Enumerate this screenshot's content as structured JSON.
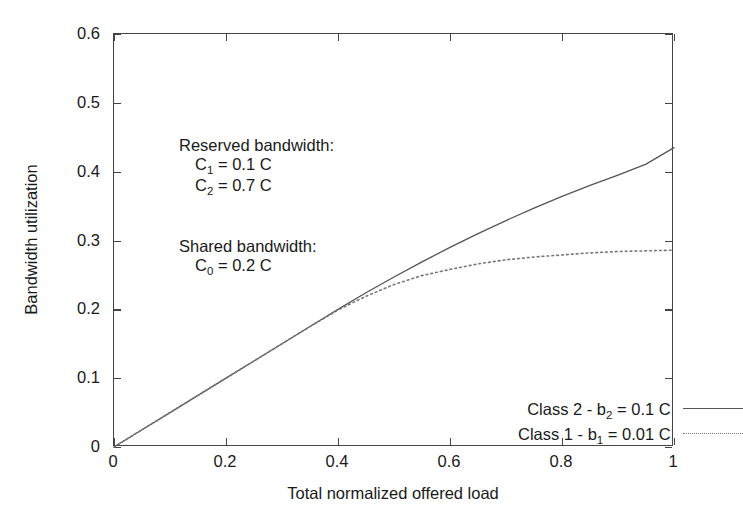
{
  "chart_data": {
    "type": "line",
    "title": "",
    "xlabel": "Total normalized offered load",
    "ylabel": "Bandwidth utilization",
    "xlim": [
      0,
      1
    ],
    "ylim": [
      0,
      0.6
    ],
    "grid": false,
    "legend_position": "lower right",
    "xticks": [
      "0",
      "0.2",
      "0.4",
      "0.6",
      "0.8",
      "1"
    ],
    "xtick_values": [
      0,
      0.2,
      0.4,
      0.6,
      0.8,
      1
    ],
    "yticks": [
      "0",
      "0.1",
      "0.2",
      "0.3",
      "0.4",
      "0.5",
      "0.6"
    ],
    "ytick_values": [
      0,
      0.1,
      0.2,
      0.3,
      0.4,
      0.5,
      0.6
    ],
    "x": [
      0,
      0.05,
      0.1,
      0.15,
      0.2,
      0.25,
      0.3,
      0.35,
      0.4,
      0.45,
      0.5,
      0.55,
      0.6,
      0.65,
      0.7,
      0.75,
      0.8,
      0.85,
      0.9,
      0.95,
      1.0
    ],
    "series": [
      {
        "name": "Class 2 - b2 = 0.1 C",
        "style": "solid",
        "color": "#555555",
        "values": [
          0,
          0.025,
          0.05,
          0.075,
          0.1,
          0.125,
          0.15,
          0.175,
          0.2,
          0.224,
          0.247,
          0.269,
          0.29,
          0.31,
          0.329,
          0.347,
          0.364,
          0.38,
          0.395,
          0.411,
          0.435
        ]
      },
      {
        "name": "Class 1 - b1 = 0.01 C",
        "style": "dotted",
        "color": "#777777",
        "values": [
          0,
          0.025,
          0.05,
          0.075,
          0.1,
          0.125,
          0.15,
          0.175,
          0.199,
          0.219,
          0.236,
          0.249,
          0.258,
          0.266,
          0.272,
          0.276,
          0.279,
          0.282,
          0.284,
          0.285,
          0.286
        ]
      }
    ],
    "annotations": [
      "Reserved bandwidth:",
      "C1 = 0.1 C",
      "C2 = 0.7 C",
      "Shared bandwidth:",
      "C0 = 0.2 C"
    ]
  },
  "annotation_block": {
    "reserved_heading": "Reserved bandwidth:",
    "reserved_c1_symbol": "C",
    "reserved_c1_sub": "1",
    "reserved_c1_value": " = 0.1 C",
    "reserved_c2_symbol": "C",
    "reserved_c2_sub": "2",
    "reserved_c2_value": " = 0.7 C",
    "shared_heading": "Shared bandwidth:",
    "shared_c0_symbol": "C",
    "shared_c0_sub": "0",
    "shared_c0_value": " = 0.2 C"
  },
  "legend": {
    "entries": [
      {
        "prefix": "Class 2 - b",
        "sub": "2",
        "suffix": " = 0.1 C",
        "style": "solid"
      },
      {
        "prefix": "Class 1 - b",
        "sub": "1",
        "suffix": " = 0.01 C",
        "style": "dotted"
      }
    ]
  },
  "axes": {
    "x_title": "Total normalized offered load",
    "y_title": "Bandwidth utilization"
  }
}
